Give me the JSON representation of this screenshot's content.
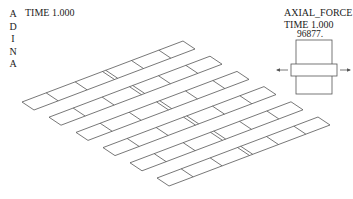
{
  "program_logo": {
    "letters": [
      "A",
      "D",
      "I",
      "N",
      "A"
    ]
  },
  "plot": {
    "time_label": "TIME 1.000"
  },
  "legend": {
    "title": "AXIAL_FORCE",
    "time_label": "TIME 1.000",
    "max_value": "96877."
  },
  "model": {
    "strip_count": 6,
    "line_color": "#555555",
    "strip_origin": [
      22,
      102
    ],
    "strip_step": [
      27,
      15.2
    ],
    "long_edge_vector": [
      161,
      -61
    ],
    "short_edge_vector": [
      12,
      8
    ],
    "divisions": [
      0.15,
      0.33,
      0.5,
      0.52,
      0.68,
      0.85
    ]
  }
}
